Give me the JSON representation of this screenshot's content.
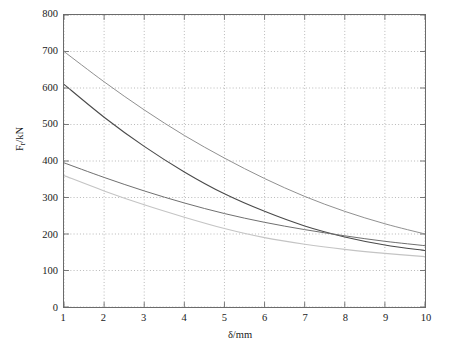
{
  "figure": {
    "background": "#ffffff",
    "frame_color": "#6b6b6b",
    "grid_color": "#9a9a9a"
  },
  "axes": {
    "x_title": "δ/mm",
    "y_title_main": "F",
    "y_title_sub": "r",
    "y_title_unit": "/kN",
    "x_ticks": [
      "1",
      "2",
      "3",
      "4",
      "5",
      "6",
      "7",
      "8",
      "9",
      "10"
    ],
    "y_ticks": [
      "0",
      "100",
      "200",
      "300",
      "400",
      "500",
      "600",
      "700",
      "800"
    ]
  },
  "chart_data": {
    "type": "line",
    "title": "",
    "xlabel": "δ/mm",
    "ylabel": "F_r/kN",
    "xlim": [
      1,
      10
    ],
    "ylim": [
      0,
      800
    ],
    "xticks": [
      1,
      2,
      3,
      4,
      5,
      6,
      7,
      8,
      9,
      10
    ],
    "yticks": [
      0,
      100,
      200,
      300,
      400,
      500,
      600,
      700,
      800
    ],
    "grid": true,
    "grid_style": "dotted",
    "legend": "none",
    "x": [
      1,
      2,
      3,
      4,
      5,
      6,
      7,
      8,
      9,
      10
    ],
    "series": [
      {
        "name": "curve-1",
        "color": "#8f8f8f",
        "width": 1.0,
        "values": [
          700,
          617,
          540,
          470,
          408,
          352,
          303,
          262,
          228,
          200
        ]
      },
      {
        "name": "curve-2",
        "color": "#4a4a4a",
        "width": 1.1,
        "values": [
          610,
          520,
          440,
          370,
          310,
          262,
          222,
          192,
          170,
          155
        ]
      },
      {
        "name": "curve-3",
        "color": "#6e6e6e",
        "width": 1.0,
        "values": [
          395,
          355,
          318,
          285,
          256,
          232,
          212,
          195,
          180,
          168
        ]
      },
      {
        "name": "curve-4",
        "color": "#c4c4c4",
        "width": 1.1,
        "values": [
          360,
          318,
          280,
          246,
          215,
          190,
          172,
          158,
          147,
          138
        ]
      }
    ]
  }
}
